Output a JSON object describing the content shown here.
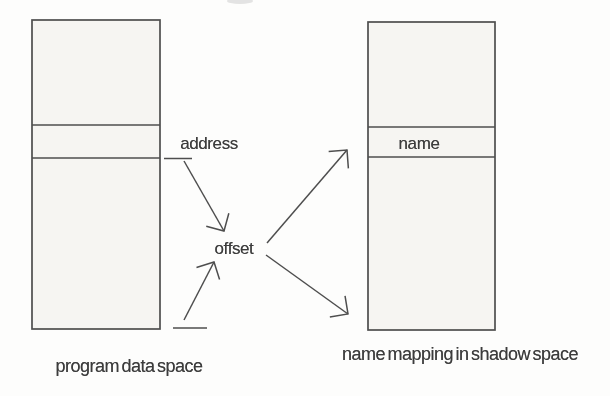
{
  "diagram": {
    "type": "block-diagram",
    "labels": {
      "address": "address",
      "offset": "offset",
      "name": "name"
    },
    "captions": {
      "left": "program data space",
      "right": "name mapping in shadow space"
    },
    "boxes": [
      {
        "id": "program-data-space",
        "caption": "program data space",
        "segments": 3,
        "middle_cell_label": ""
      },
      {
        "id": "shadow-space",
        "caption": "name mapping in shadow space",
        "segments": 3,
        "middle_cell_label": "name"
      }
    ],
    "arrows": [
      {
        "from": "address-cell",
        "to": "offset"
      },
      {
        "from": "program-data-space-bottom",
        "to": "offset"
      },
      {
        "from": "offset",
        "to": "name-cell"
      },
      {
        "from": "offset",
        "to": "shadow-space-bottom"
      }
    ],
    "colors": {
      "line": "#4e4e4e",
      "text": "#3c3c3c",
      "box_fill": "#f6f5f2",
      "background": "#fdfdfc"
    }
  }
}
